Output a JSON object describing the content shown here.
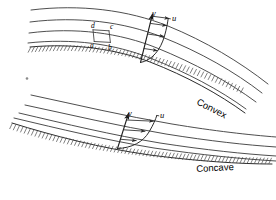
{
  "figure": {
    "background_color": "#ffffff",
    "line_color": "#2b2b2b",
    "width": 276,
    "height": 200
  },
  "panels": [
    {
      "id": "convex",
      "wall_label": "Convex",
      "axis_y_label": "y",
      "velocity_label": "u",
      "element_labels": {
        "a": "a",
        "b": "b",
        "c": "c",
        "d": "d"
      },
      "streamline_count": 4,
      "velocity_arrow_count": 4,
      "hatch_side": "below"
    },
    {
      "id": "concave",
      "wall_label": "Concave",
      "axis_y_label": "y",
      "velocity_label": "u",
      "element_labels": {},
      "streamline_count": 4,
      "velocity_arrow_count": 3,
      "hatch_side": "below"
    }
  ],
  "labels": {
    "y_axis": "y",
    "u_axis": "u",
    "elem_a": "a",
    "elem_b": "b",
    "elem_c": "c",
    "elem_d": "d",
    "convex": "Convex",
    "concave": "Concave"
  }
}
